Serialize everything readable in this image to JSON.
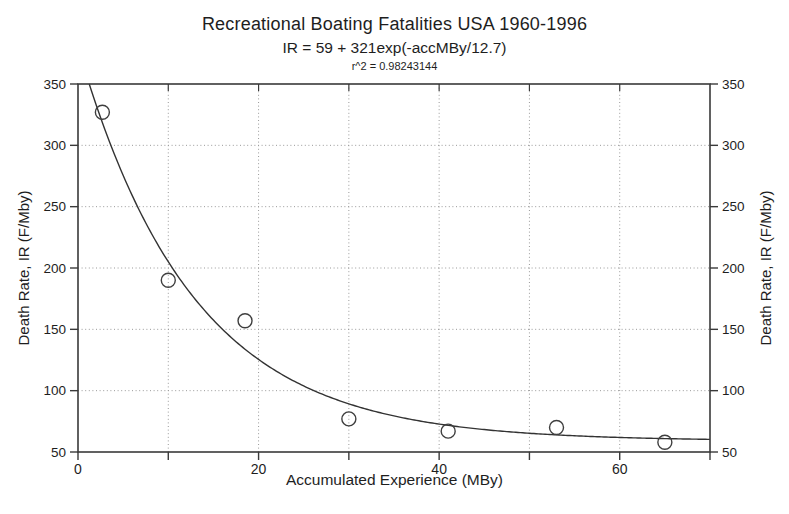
{
  "figure": {
    "title": "Recreational Boating Fatalities USA 1960-1996",
    "subtitle": "IR = 59 + 321exp(-accMBy/12.7)",
    "r_squared": "r^2 = 0.98243144"
  },
  "chart_data": {
    "type": "scatter",
    "title": "Recreational Boating Fatalities USA 1960-1996",
    "subtitle": "IR = 59 + 321exp(-accMBy/12.7)",
    "annotation": "r^2 = 0.98243144",
    "xlabel": "Accumulated Experience (MBy)",
    "ylabel_left": "Death Rate, IR (F/Mby)",
    "ylabel_right": "Death Rate, IR (F/Mby)",
    "xlim": [
      0,
      70
    ],
    "ylim": [
      50,
      350
    ],
    "x_tick_labels": [
      0,
      20,
      40,
      60
    ],
    "x_all_ticks": [
      0,
      10,
      20,
      30,
      40,
      50,
      60,
      70
    ],
    "y_ticks": [
      50,
      100,
      150,
      200,
      250,
      300,
      350
    ],
    "x_gridlines": [
      10,
      20,
      30,
      40,
      50,
      60
    ],
    "y_gridlines": [
      100,
      150,
      200,
      250,
      300
    ],
    "grid": "dotted",
    "legend": "none",
    "points": [
      {
        "x": 2.7,
        "y": 327
      },
      {
        "x": 10,
        "y": 190
      },
      {
        "x": 18.5,
        "y": 157
      },
      {
        "x": 30,
        "y": 77
      },
      {
        "x": 41,
        "y": 67
      },
      {
        "x": 53,
        "y": 70
      },
      {
        "x": 65,
        "y": 58
      }
    ],
    "fit_curve": {
      "formula": "IR = 59 + 321exp(-accMBy/12.7)",
      "offset": 59,
      "amplitude": 321,
      "decay": 12.7
    },
    "colors": {
      "text": "#1e1e1e",
      "axis": "#3a3a3a",
      "grid": "#999999",
      "curve": "#333333",
      "marker": "#3f3f3f",
      "background": "#ffffff"
    }
  }
}
